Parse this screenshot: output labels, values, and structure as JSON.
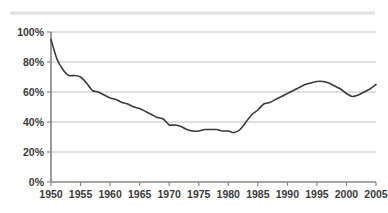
{
  "chart_data": {
    "type": "line",
    "title": "",
    "subtitle": "",
    "xlabel": "",
    "ylabel": "",
    "xlim": [
      1950,
      2005
    ],
    "ylim": [
      0,
      100
    ],
    "grid": true,
    "legend": false,
    "legend_position": "none",
    "y_tick_labels": [
      "0%",
      "20%",
      "40%",
      "60%",
      "80%",
      "100%"
    ],
    "y_tick_values": [
      0,
      20,
      40,
      60,
      80,
      100
    ],
    "x_tick_labels": [
      "1950",
      "1955",
      "1960",
      "1965",
      "1970",
      "1975",
      "1980",
      "1985",
      "1990",
      "1995",
      "2000",
      "2005"
    ],
    "x_tick_values": [
      1950,
      1955,
      1960,
      1965,
      1970,
      1975,
      1980,
      1985,
      1990,
      1995,
      2000,
      2005
    ],
    "line_color": "#3a3a3a",
    "gridline_color": "#b9b9b9",
    "axis_color": "#888888",
    "background_color": "#ffffff",
    "series": [
      {
        "name": "series-1",
        "x": [
          1950,
          1951,
          1952,
          1953,
          1954,
          1955,
          1956,
          1957,
          1958,
          1959,
          1960,
          1961,
          1962,
          1963,
          1964,
          1965,
          1966,
          1967,
          1968,
          1969,
          1970,
          1971,
          1972,
          1973,
          1974,
          1975,
          1976,
          1977,
          1978,
          1979,
          1980,
          1981,
          1982,
          1983,
          1984,
          1985,
          1986,
          1987,
          1988,
          1989,
          1990,
          1991,
          1992,
          1993,
          1994,
          1995,
          1996,
          1997,
          1998,
          1999,
          2000,
          2001,
          2002,
          2003,
          2004,
          2005
        ],
        "values": [
          95,
          82,
          75,
          71,
          71,
          70,
          66,
          61,
          60,
          58,
          56,
          55,
          53,
          52,
          50,
          49,
          47,
          45,
          43,
          42,
          38,
          38,
          37,
          35,
          34,
          34,
          35,
          35,
          35,
          34,
          34,
          33,
          35,
          40,
          45,
          48,
          52,
          53,
          55,
          57,
          59,
          61,
          63,
          65,
          66,
          67,
          67,
          66,
          64,
          62,
          59,
          57,
          58,
          60,
          62,
          65
        ]
      }
    ]
  },
  "decor": {
    "top_band_label": "page-artifact-band"
  }
}
